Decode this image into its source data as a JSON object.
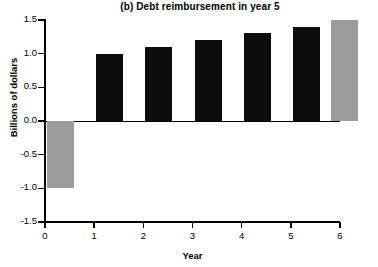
{
  "chart_data": {
    "type": "bar",
    "title": "(b) Debt reimbursement in year 5",
    "xlabel": "Year",
    "ylabel": "Billions of dollars",
    "categories": [
      "0",
      "1",
      "2",
      "3",
      "4",
      "5"
    ],
    "values": [
      -1.0,
      1.0,
      1.1,
      1.2,
      1.3,
      1.4
    ],
    "extra_bar": {
      "category": "5",
      "value": 1.5,
      "color": "#9c9c9c"
    },
    "bars": [
      {
        "x": 0,
        "value": -1.0,
        "color": "#9c9c9c",
        "style": "gray"
      },
      {
        "x": 1,
        "value": 1.0,
        "color": "#0d0d0d",
        "style": "black"
      },
      {
        "x": 2,
        "value": 1.1,
        "color": "#0d0d0d",
        "style": "black"
      },
      {
        "x": 3,
        "value": 1.2,
        "color": "#0d0d0d",
        "style": "black"
      },
      {
        "x": 4,
        "value": 1.3,
        "color": "#0d0d0d",
        "style": "black"
      },
      {
        "x": 5,
        "value": 1.4,
        "color": "#0d0d0d",
        "style": "black"
      },
      {
        "x": 6,
        "value": 1.5,
        "color": "#9c9c9c",
        "style": "gray"
      }
    ],
    "ylim": [
      -1.5,
      1.5
    ],
    "xlim": [
      0,
      6
    ],
    "yticks": [
      "1.5",
      "1.0",
      "0.5",
      "0.0",
      "-0.5",
      "-1.0",
      "-1.5"
    ],
    "ytick_values": [
      1.5,
      1.0,
      0.5,
      0.0,
      -0.5,
      -1.0,
      -1.5
    ],
    "xticks": [
      "0",
      "1",
      "2",
      "3",
      "4",
      "5",
      "6"
    ],
    "xtick_values": [
      0,
      1,
      2,
      3,
      4,
      5,
      6
    ],
    "grid": false,
    "legend": null,
    "colors": {
      "positive": "#0d0d0d",
      "highlight": "#9c9c9c",
      "axis": "#000000"
    }
  }
}
